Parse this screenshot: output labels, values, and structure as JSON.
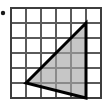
{
  "figure": {
    "width": 108,
    "height": 107,
    "background_color": "#ffffff"
  },
  "grid": {
    "columns": 6,
    "rows": 6,
    "cell_size": 15,
    "origin_x": 11,
    "origin_y": 8,
    "line_color": "#5a5a5a",
    "border_color": "#3d3d3d",
    "line_width": 1.4,
    "border_width": 1.8
  },
  "shape": {
    "name": "triangle",
    "vertices_grid": [
      {
        "col": 1,
        "row": 5
      },
      {
        "col": 5,
        "row": 1
      },
      {
        "col": 5,
        "row": 6
      }
    ],
    "vertices_px": [
      {
        "x": 26,
        "y": 83
      },
      {
        "x": 86,
        "y": 23
      },
      {
        "x": 86,
        "y": 98
      }
    ],
    "points_attr": "26,83 86,23 86,98",
    "fill_color": "#c6c6c6",
    "stroke_color": "#000000",
    "stroke_width": 3
  },
  "marker": {
    "name": "bullet-dot",
    "x": 3,
    "y": 13,
    "radius": 2.2,
    "color": "#1a1a1a"
  }
}
